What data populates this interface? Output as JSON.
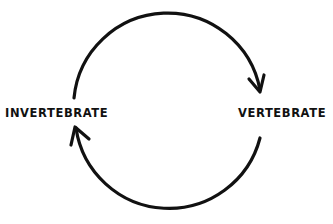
{
  "diagram": {
    "type": "cycle",
    "nodes": [
      {
        "id": "invertebrate",
        "label": "INVERTEBRATE"
      },
      {
        "id": "vertebrate",
        "label": "VERTEBRATE"
      }
    ],
    "edges": [
      {
        "from": "invertebrate",
        "to": "vertebrate",
        "path": "upper-arc"
      },
      {
        "from": "vertebrate",
        "to": "invertebrate",
        "path": "lower-arc"
      }
    ],
    "colors": {
      "stroke": "#111111",
      "background": "#ffffff"
    }
  }
}
